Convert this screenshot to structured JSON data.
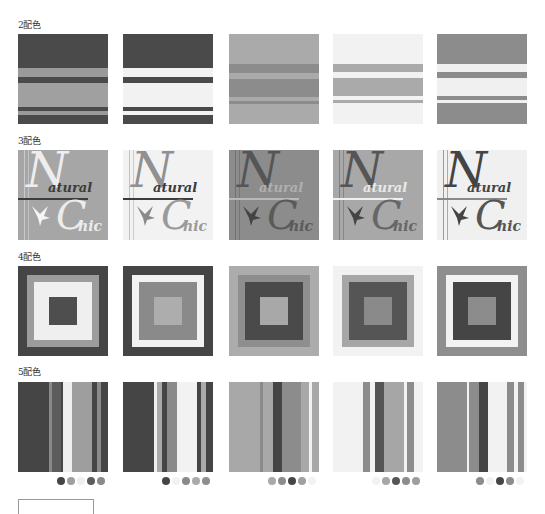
{
  "sections": [
    {
      "label": "2配色"
    },
    {
      "label": "3配色"
    },
    {
      "label": "4配色"
    },
    {
      "label": "5配色"
    }
  ],
  "stripes2": [
    {
      "bands": [
        [
          "#4a4a4a",
          0,
          34
        ],
        [
          "#9a9a9a",
          34,
          9
        ],
        [
          "#4a4a4a",
          43,
          6
        ],
        [
          "#a0a0a0",
          49,
          24
        ],
        [
          "#4a4a4a",
          73,
          4
        ],
        [
          "#9a9a9a",
          77,
          4
        ],
        [
          "#4a4a4a",
          81,
          9
        ]
      ]
    },
    {
      "bands": [
        [
          "#4a4a4a",
          0,
          34
        ],
        [
          "#f2f2f2",
          34,
          9
        ],
        [
          "#4a4a4a",
          43,
          6
        ],
        [
          "#f2f2f2",
          49,
          24
        ],
        [
          "#4a4a4a",
          73,
          4
        ],
        [
          "#f2f2f2",
          77,
          4
        ],
        [
          "#4a4a4a",
          81,
          9
        ]
      ]
    },
    {
      "bands": [
        [
          "#aaaaaa",
          0,
          30
        ],
        [
          "#8c8c8c",
          30,
          9
        ],
        [
          "#aaaaaa",
          39,
          6
        ],
        [
          "#8c8c8c",
          45,
          18
        ],
        [
          "#aaaaaa",
          63,
          4
        ],
        [
          "#8c8c8c",
          67,
          3
        ],
        [
          "#aaaaaa",
          70,
          20
        ]
      ]
    },
    {
      "bands": [
        [
          "#f2f2f2",
          0,
          30
        ],
        [
          "#aaaaaa",
          30,
          8
        ],
        [
          "#f2f2f2",
          38,
          6
        ],
        [
          "#aaaaaa",
          44,
          18
        ],
        [
          "#f2f2f2",
          62,
          4
        ],
        [
          "#aaaaaa",
          66,
          3
        ],
        [
          "#f2f2f2",
          69,
          21
        ]
      ]
    },
    {
      "bands": [
        [
          "#8c8c8c",
          0,
          30
        ],
        [
          "#f0f0f0",
          30,
          8
        ],
        [
          "#8c8c8c",
          38,
          6
        ],
        [
          "#f0f0f0",
          44,
          18
        ],
        [
          "#8c8c8c",
          62,
          4
        ],
        [
          "#f0f0f0",
          66,
          3
        ],
        [
          "#8c8c8c",
          69,
          21
        ]
      ]
    }
  ],
  "logos": [
    {
      "bg": "#a6a6a6",
      "script": "#eeeeee",
      "word": "#3c3c3c",
      "line": "#3c3c3c",
      "bird": "#f5f5f5",
      "chic_text": "#ececec",
      "n_text": "N",
      "a_text": "atural",
      "c_text": "C",
      "h_text": "hic"
    },
    {
      "bg": "#f2f2f2",
      "script": "#909090",
      "word": "#3c3c3c",
      "line": "#3c3c3c",
      "bird": "#8a8a8a",
      "chic_text": "#9a9a9a",
      "n_text": "N",
      "a_text": "atural",
      "c_text": "C",
      "h_text": "hic"
    },
    {
      "bg": "#8c8c8c",
      "script": "#555555",
      "word": "#b0b0b0",
      "line": "#b8b8b8",
      "bird": "#444444",
      "chic_text": "#5a5a5a",
      "n_text": "N",
      "a_text": "atural",
      "c_text": "C",
      "h_text": "hic"
    },
    {
      "bg": "#a8a8a8",
      "script": "#555555",
      "word": "#e8e8e8",
      "line": "#f0f0f0",
      "bird": "#444444",
      "chic_text": "#666666",
      "n_text": "N",
      "a_text": "atural",
      "c_text": "C",
      "h_text": "hic"
    },
    {
      "bg": "#f0f0f0",
      "script": "#444444",
      "word": "#444444",
      "line": "#888888",
      "bird": "#444444",
      "chic_text": "#555555",
      "n_text": "N",
      "a_text": "atural",
      "c_text": "C",
      "h_text": "hic"
    }
  ],
  "squares4": [
    {
      "rings": [
        "#454545",
        "#9c9c9c",
        "#efefef",
        "#4e4e4e"
      ]
    },
    {
      "rings": [
        "#454545",
        "#f2f2f2",
        "#8a8a8a",
        "#adadad"
      ]
    },
    {
      "rings": [
        "#acacac",
        "#8e8e8e",
        "#4a4a4a",
        "#a8a8a8"
      ]
    },
    {
      "rings": [
        "#f2f2f2",
        "#a6a6a6",
        "#555555",
        "#8a8a8a"
      ]
    },
    {
      "rings": [
        "#8e8e8e",
        "#f2f2f2",
        "#454545",
        "#8c8c8c"
      ]
    }
  ],
  "stripes5": [
    {
      "bands": [
        [
          "#454545",
          0,
          31
        ],
        [
          "#8a8a8a",
          31,
          3
        ],
        [
          "#5c5c5c",
          34,
          9
        ],
        [
          "#454545",
          43,
          2
        ],
        [
          "#efefef",
          45,
          9
        ],
        [
          "#9e9e9e",
          54,
          20
        ],
        [
          "#454545",
          74,
          5
        ],
        [
          "#8a8a8a",
          79,
          4
        ],
        [
          "#454545",
          83,
          7
        ]
      ],
      "dots": [
        "#454545",
        "#9e9e9e",
        "#efefef",
        "#5c5c5c",
        "#8a8a8a"
      ]
    },
    {
      "bands": [
        [
          "#454545",
          0,
          31
        ],
        [
          "#efefef",
          31,
          3
        ],
        [
          "#aaaaaa",
          34,
          5
        ],
        [
          "#454545",
          39,
          5
        ],
        [
          "#8a8a8a",
          44,
          10
        ],
        [
          "#f2f2f2",
          54,
          20
        ],
        [
          "#454545",
          74,
          4
        ],
        [
          "#aaaaaa",
          78,
          5
        ],
        [
          "#454545",
          83,
          7
        ]
      ],
      "dots": [
        "#454545",
        "#f2f2f2",
        "#8a8a8a",
        "#aaaaaa",
        "#8e8e8e"
      ]
    },
    {
      "bands": [
        [
          "#a8a8a8",
          0,
          31
        ],
        [
          "#8a8a8a",
          31,
          3
        ],
        [
          "#a8a8a8",
          34,
          10
        ],
        [
          "#454545",
          44,
          9
        ],
        [
          "#8c8c8c",
          53,
          19
        ],
        [
          "#a8a8a8",
          72,
          8
        ],
        [
          "#f2f2f2",
          80,
          3
        ],
        [
          "#a8a8a8",
          83,
          7
        ]
      ],
      "dots": [
        "#a8a8a8",
        "#8c8c8c",
        "#454545",
        "#a0a0a0",
        "#f2f2f2"
      ]
    },
    {
      "bands": [
        [
          "#f2f2f2",
          0,
          30
        ],
        [
          "#8c8c8c",
          30,
          7
        ],
        [
          "#f2f2f2",
          37,
          5
        ],
        [
          "#555555",
          42,
          9
        ],
        [
          "#a6a6a6",
          51,
          20
        ],
        [
          "#f2f2f2",
          71,
          3
        ],
        [
          "#8c8c8c",
          74,
          7
        ],
        [
          "#f2f2f2",
          81,
          9
        ]
      ],
      "dots": [
        "#f2f2f2",
        "#a6a6a6",
        "#555555",
        "#8c8c8c",
        "#9e9e9e"
      ]
    },
    {
      "bands": [
        [
          "#8c8c8c",
          0,
          30
        ],
        [
          "#f2f2f2",
          30,
          2
        ],
        [
          "#8c8c8c",
          32,
          10
        ],
        [
          "#454545",
          42,
          9
        ],
        [
          "#f2f2f2",
          51,
          19
        ],
        [
          "#8c8c8c",
          70,
          7
        ],
        [
          "#f2f2f2",
          77,
          4
        ],
        [
          "#8c8c8c",
          81,
          6
        ],
        [
          "#f2f2f2",
          87,
          3
        ]
      ],
      "dots": [
        "#8c8c8c",
        "#f2f2f2",
        "#454545",
        "#8c8c8c",
        "#f2f2f2"
      ]
    }
  ]
}
